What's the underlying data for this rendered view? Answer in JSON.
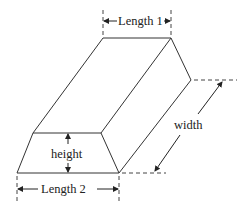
{
  "diagram": {
    "type": "prism-trapezoid-cross-section",
    "labels": {
      "length1": "Length 1",
      "length2": "Length 2",
      "height": "height",
      "width": "width"
    },
    "colors": {
      "line": "#333333",
      "background": "#ffffff"
    }
  }
}
